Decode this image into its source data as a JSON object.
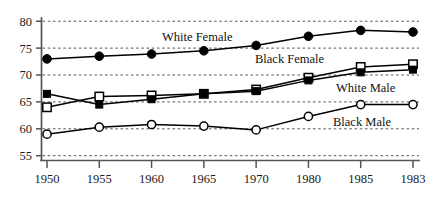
{
  "chart_data": {
    "type": "line",
    "title": "",
    "subtitle": "",
    "xlabel": "",
    "ylabel": "",
    "x": [
      "1950",
      "1955",
      "1960",
      "1965",
      "1970",
      "1980",
      "1985",
      "1983"
    ],
    "categories": [
      "1950",
      "1955",
      "1960",
      "1965",
      "1970",
      "1980",
      "1985",
      "1983"
    ],
    "xtick_labels": [
      "1950",
      "1955",
      "1960",
      "1965",
      "1970",
      "1980",
      "1985",
      "1983"
    ],
    "ytick_labels": [
      "55",
      "60",
      "65",
      "70",
      "75",
      "80"
    ],
    "ytick_values": [
      55,
      60,
      65,
      70,
      75,
      80
    ],
    "ylim": [
      54.2,
      80.6
    ],
    "grid": "horizontal-dotted",
    "legend_position": "inline-annotations",
    "series": [
      {
        "name": "White Female",
        "marker": "filled-circle",
        "color": "#000000",
        "values": [
          73.0,
          73.5,
          73.9,
          74.5,
          75.5,
          77.2,
          78.3,
          78.0
        ]
      },
      {
        "name": "Black Female",
        "marker": "open-square",
        "color": "#000000",
        "values": [
          64.0,
          66.0,
          66.2,
          66.5,
          67.3,
          69.5,
          71.5,
          72.0
        ]
      },
      {
        "name": "White Male",
        "marker": "filled-square",
        "color": "#000000",
        "values": [
          66.5,
          64.5,
          65.5,
          66.5,
          67.0,
          69.0,
          70.5,
          71.0
        ]
      },
      {
        "name": "Black Male",
        "marker": "open-circle",
        "color": "#000000",
        "values": [
          59.0,
          60.3,
          60.8,
          60.5,
          59.8,
          62.3,
          64.5,
          64.5
        ]
      }
    ],
    "annotations": [
      {
        "text": "White Female",
        "series": "White Female",
        "x_px": 162,
        "y_px": 41
      },
      {
        "text": "Black Female",
        "series": "Black Female",
        "x_px": 255,
        "y_px": 63
      },
      {
        "text": "White Male",
        "series": "White Male",
        "x_px": 336,
        "y_px": 92
      },
      {
        "text": "Black Male",
        "series": "Black Male",
        "x_px": 333,
        "y_px": 126
      }
    ]
  }
}
